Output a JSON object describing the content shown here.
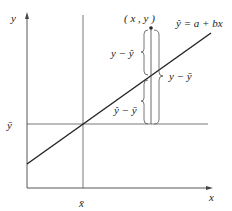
{
  "diagram": {
    "axes": {
      "x_label": "x",
      "y_label": "y"
    },
    "x_mean_label": "x̄",
    "y_mean_label": "ȳ",
    "point_label": "( x , y )",
    "regression_line_label": "ŷ = a + bx",
    "brace_labels": {
      "residual": "y − ŷ",
      "explained": "ŷ − ȳ",
      "total": "y − ȳ"
    },
    "colors": {
      "line": "#222222",
      "axis": "#444444",
      "background": "#ffffff"
    }
  }
}
